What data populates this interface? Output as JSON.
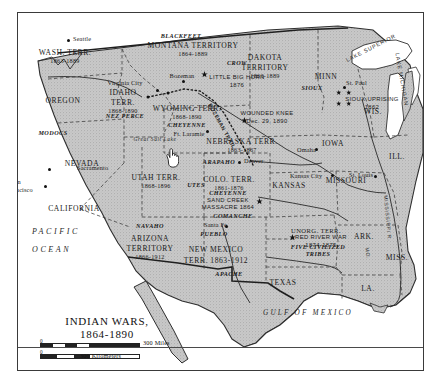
{
  "title": {
    "line1": "INDIAN WARS,",
    "line2": "1864-1890"
  },
  "scale": {
    "miles_zero": "0",
    "miles_value": "300 Miles",
    "km_zero": "0",
    "km_value": "300 Kilometers"
  },
  "water": {
    "pacific_line1": "PACIFIC",
    "pacific_line2": "OCEAN",
    "gulf": "GULF OF MEXICO",
    "lake_superior": "LAKE SUPERIOR",
    "lake_michigan": "LAKE MICHIGAN",
    "great_salt_lake": "Great Salt Lake",
    "mississippi_river": "MISSISSIPPI R.",
    "missouri_river": "MO."
  },
  "states": [
    {
      "name": "WASH. TERR.",
      "dates": "1863-1889",
      "x": 64,
      "y": 48,
      "size": "state"
    },
    {
      "name": "OREGON",
      "dates": "",
      "x": 62,
      "y": 96,
      "size": "state"
    },
    {
      "name": "IDAHO",
      "dates": "",
      "x": 122,
      "y": 88,
      "size": "state"
    },
    {
      "name": "TERR.",
      "dates": "1868-1890",
      "x": 122,
      "y": 98,
      "size": "state"
    },
    {
      "name": "MONTANA TERRITORY",
      "dates": "1864-1889",
      "x": 192,
      "y": 41,
      "size": "state"
    },
    {
      "name": "DAKOTA",
      "dates": "",
      "x": 264,
      "y": 53,
      "size": "state"
    },
    {
      "name": "TERRITORY",
      "dates": "1863-1889",
      "x": 264,
      "y": 63,
      "size": "state"
    },
    {
      "name": "WYOMING TERR.",
      "dates": "1868-1890",
      "x": 186,
      "y": 104,
      "size": "state"
    },
    {
      "name": "NEBRASKA TERR.",
      "dates": "1863-1867",
      "x": 241,
      "y": 137,
      "size": "state"
    },
    {
      "name": "NEVADA",
      "dates": "",
      "x": 81,
      "y": 159,
      "size": "state"
    },
    {
      "name": "UTAH TERR.",
      "dates": "1868-1896",
      "x": 155,
      "y": 173,
      "size": "state"
    },
    {
      "name": "COLO. TERR.",
      "dates": "1861-1876",
      "x": 228,
      "y": 175,
      "size": "state"
    },
    {
      "name": "CALIFORNIA",
      "dates": "",
      "x": 73,
      "y": 204,
      "size": "state"
    },
    {
      "name": "ARIZONA",
      "dates": "",
      "x": 149,
      "y": 234,
      "size": "state"
    },
    {
      "name": "TERRITORY",
      "dates": "1866-1912",
      "x": 149,
      "y": 244,
      "size": "state"
    },
    {
      "name": "NEW MEXICO",
      "dates": "",
      "x": 215,
      "y": 245,
      "size": "state"
    },
    {
      "name": "TERR. 1863-1912",
      "dates": "",
      "x": 215,
      "y": 256,
      "size": "state"
    },
    {
      "name": "KANSAS",
      "dates": "",
      "x": 288,
      "y": 181,
      "size": "state"
    },
    {
      "name": "TEXAS",
      "dates": "",
      "x": 282,
      "y": 278,
      "size": "state"
    },
    {
      "name": "MINN",
      "dates": "",
      "x": 325,
      "y": 72,
      "size": "state"
    },
    {
      "name": "IOWA",
      "dates": "",
      "x": 332,
      "y": 139,
      "size": "state"
    },
    {
      "name": "MISSOURI",
      "dates": "",
      "x": 345,
      "y": 176,
      "size": "state"
    },
    {
      "name": "WIS.",
      "dates": "",
      "x": 372,
      "y": 107,
      "size": "state"
    },
    {
      "name": "ILL.",
      "dates": "",
      "x": 396,
      "y": 152,
      "size": "state"
    },
    {
      "name": "ARK.",
      "dates": "",
      "x": 363,
      "y": 232,
      "size": "state"
    },
    {
      "name": "MISS.",
      "dates": "",
      "x": 396,
      "y": 253,
      "size": "state"
    },
    {
      "name": "LA.",
      "dates": "",
      "x": 367,
      "y": 284,
      "size": "state"
    },
    {
      "name": "UNORG. TERR.",
      "dates": "",
      "x": 315,
      "y": 226,
      "size": "state-sm"
    }
  ],
  "tribes": [
    {
      "name": "BLACKFEET",
      "x": 180,
      "y": 32
    },
    {
      "name": "CROW",
      "x": 236,
      "y": 59
    },
    {
      "name": "NEZ PERCE",
      "x": 124,
      "y": 112
    },
    {
      "name": "MODOCS",
      "x": 52,
      "y": 129
    },
    {
      "name": "CHEYENNE",
      "x": 186,
      "y": 121
    },
    {
      "name": "SIOUX",
      "x": 311,
      "y": 84
    },
    {
      "name": "ARAPAHO",
      "x": 218,
      "y": 158
    },
    {
      "name": "CHEYENNE",
      "x": 227,
      "y": 189
    },
    {
      "name": "UTES",
      "x": 195,
      "y": 181
    },
    {
      "name": "NAVAHO",
      "x": 149,
      "y": 222
    },
    {
      "name": "PUEBLO",
      "x": 213,
      "y": 230
    },
    {
      "name": "COMANCHE",
      "x": 232,
      "y": 212
    },
    {
      "name": "APACHE",
      "x": 228,
      "y": 270
    },
    {
      "name": "FIVE CIVILIZED",
      "x": 317,
      "y": 243
    },
    {
      "name": "TRIBES",
      "x": 317,
      "y": 250
    }
  ],
  "cities": [
    {
      "name": "Seattle",
      "x": 72,
      "y": 35,
      "dotx": 66,
      "doty": 38,
      "anchor": "left"
    },
    {
      "name": "Virginia City",
      "x": 124,
      "y": 79,
      "dotx": 155,
      "doty": 88,
      "anchor": "center"
    },
    {
      "name": "Bozeman",
      "x": 181,
      "y": 72,
      "dotx": 181,
      "doty": 79,
      "anchor": "center"
    },
    {
      "name": "Ft. Laramie",
      "x": 188,
      "y": 130,
      "dotx": 205,
      "doty": 129,
      "anchor": "center"
    },
    {
      "name": "Sacramento",
      "x": 76,
      "y": 164,
      "dotx": 47,
      "doty": 167,
      "anchor": "left"
    },
    {
      "name": "San",
      "x": 10,
      "y": 178,
      "dotx": 43,
      "doty": 184,
      "anchor": "left"
    },
    {
      "name": "Francisco",
      "x": 6,
      "y": 186,
      "dotx": -1,
      "doty": -1,
      "anchor": "left"
    },
    {
      "name": "Denver",
      "x": 243,
      "y": 157,
      "dotx": 237,
      "doty": 160,
      "anchor": "left"
    },
    {
      "name": "Santa Fe",
      "x": 203,
      "y": 221,
      "dotx": 224,
      "doty": 224,
      "anchor": "left"
    },
    {
      "name": "Omaha",
      "x": 296,
      "y": 146,
      "dotx": 314,
      "doty": 147,
      "anchor": "left"
    },
    {
      "name": "Kansas City",
      "x": 289,
      "y": 172,
      "dotx": 330,
      "doty": 173,
      "anchor": "left"
    },
    {
      "name": "St. Louis",
      "x": 348,
      "y": 171,
      "dotx": 373,
      "doty": 174,
      "anchor": "left"
    },
    {
      "name": "St. Paul",
      "x": 345,
      "y": 79,
      "dotx": 342,
      "doty": 85,
      "anchor": "left"
    }
  ],
  "battles": [
    {
      "name": "LITTLE BIG HORN",
      "date": "1876",
      "x": 236,
      "y": 73,
      "starx": 203,
      "stary": 73
    },
    {
      "name": "WOUNDED KNEE",
      "date": "Dec. 29, 1890",
      "x": 266,
      "y": 109,
      "starx": 243,
      "stary": 119
    },
    {
      "name": "SIOUX UPRISING",
      "date": "1862",
      "x": 371,
      "y": 95,
      "starx": -1,
      "stary": -1
    },
    {
      "name": "SAND CREEK",
      "date": "",
      "x": 227,
      "y": 196,
      "starx": -1,
      "stary": -1
    },
    {
      "name": "MASSACRE 1864",
      "date": "",
      "x": 227,
      "y": 203,
      "starx": 258,
      "stary": 200
    },
    {
      "name": "RED RIVER WAR",
      "date": "1874-1875",
      "x": 320,
      "y": 233,
      "starx": 291,
      "stary": 236
    }
  ],
  "trail": {
    "name": "BOZEMAN TRAIL"
  },
  "cursor": {
    "type": "pointing-hand-cursor"
  }
}
